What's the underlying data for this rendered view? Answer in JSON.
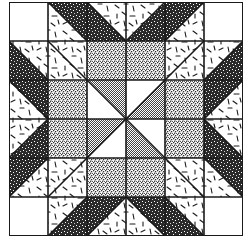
{
  "grid": {
    "rows": 6,
    "cols": 6
  },
  "fabrics": {
    "white": "#ffffff",
    "confetti": "confetti",
    "dark": "dark-speckle",
    "stipple": "fine-stipple",
    "gray": "gray-check"
  },
  "colors": {
    "ink": "#1a1a1a",
    "paper": "#ffffff"
  },
  "cells": [
    [
      {
        "t": "solid",
        "f": "white"
      },
      {
        "t": "hst",
        "d": "tlbr",
        "a": "dark",
        "b": "confetti"
      },
      {
        "t": "hst",
        "d": "tlbr",
        "a": "confetti",
        "b": "dark"
      },
      {
        "t": "hst",
        "d": "bltr",
        "a": "confetti",
        "b": "dark"
      },
      {
        "t": "hst",
        "d": "bltr",
        "a": "dark",
        "b": "confetti"
      },
      {
        "t": "solid",
        "f": "white"
      }
    ],
    [
      {
        "t": "hst",
        "d": "tlbr",
        "a": "confetti",
        "b": "dark"
      },
      {
        "t": "hst",
        "d": "tlbr",
        "a": "confetti",
        "b": "confetti"
      },
      {
        "t": "solid",
        "f": "stipple"
      },
      {
        "t": "solid",
        "f": "stipple"
      },
      {
        "t": "hst",
        "d": "bltr",
        "a": "confetti",
        "b": "confetti"
      },
      {
        "t": "hst",
        "d": "bltr",
        "a": "confetti",
        "b": "dark"
      }
    ],
    [
      {
        "t": "hst",
        "d": "tlbr",
        "a": "dark",
        "b": "confetti"
      },
      {
        "t": "solid",
        "f": "stipple"
      },
      {
        "t": "hst",
        "d": "tlbr",
        "a": "gray",
        "b": "white"
      },
      {
        "t": "hst",
        "d": "bltr",
        "a": "white",
        "b": "gray"
      },
      {
        "t": "solid",
        "f": "stipple"
      },
      {
        "t": "hst",
        "d": "bltr",
        "a": "dark",
        "b": "confetti"
      }
    ],
    [
      {
        "t": "hst",
        "d": "bltr",
        "a": "confetti",
        "b": "dark"
      },
      {
        "t": "solid",
        "f": "stipple"
      },
      {
        "t": "hst",
        "d": "bltr",
        "a": "gray",
        "b": "white"
      },
      {
        "t": "hst",
        "d": "tlbr",
        "a": "white",
        "b": "gray"
      },
      {
        "t": "solid",
        "f": "stipple"
      },
      {
        "t": "hst",
        "d": "tlbr",
        "a": "confetti",
        "b": "dark"
      }
    ],
    [
      {
        "t": "hst",
        "d": "bltr",
        "a": "dark",
        "b": "confetti"
      },
      {
        "t": "hst",
        "d": "bltr",
        "a": "confetti",
        "b": "confetti"
      },
      {
        "t": "solid",
        "f": "stipple"
      },
      {
        "t": "solid",
        "f": "stipple"
      },
      {
        "t": "hst",
        "d": "tlbr",
        "a": "confetti",
        "b": "confetti"
      },
      {
        "t": "hst",
        "d": "tlbr",
        "a": "dark",
        "b": "confetti"
      }
    ],
    [
      {
        "t": "solid",
        "f": "white"
      },
      {
        "t": "hst",
        "d": "bltr",
        "a": "confetti",
        "b": "dark"
      },
      {
        "t": "hst",
        "d": "bltr",
        "a": "dark",
        "b": "confetti"
      },
      {
        "t": "hst",
        "d": "tlbr",
        "a": "dark",
        "b": "confetti"
      },
      {
        "t": "hst",
        "d": "tlbr",
        "a": "confetti",
        "b": "dark"
      },
      {
        "t": "solid",
        "f": "white"
      }
    ]
  ]
}
